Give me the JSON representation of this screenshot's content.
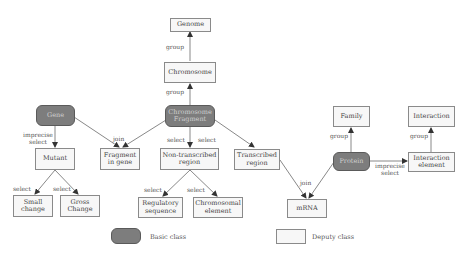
{
  "diagram": {
    "nodes": {
      "genome": {
        "label": "Genome",
        "type": "deputy"
      },
      "chromosome": {
        "label": "Chromosome",
        "type": "deputy"
      },
      "gene": {
        "label": "Gene",
        "type": "basic"
      },
      "chromosome_fragment": {
        "label": "Chromosome Fragment",
        "type": "basic"
      },
      "mutant": {
        "label": "Mutant",
        "type": "deputy"
      },
      "fragment_in_gene": {
        "label": "Fragment in gene",
        "type": "deputy"
      },
      "non_transcribed_region": {
        "label": "Non-transcribed region",
        "type": "deputy"
      },
      "transcribed_region": {
        "label": "Transcribed region",
        "type": "deputy"
      },
      "small_change": {
        "label": "Small change",
        "type": "deputy"
      },
      "gross_change": {
        "label": "Gross Change",
        "type": "deputy"
      },
      "regulatory_sequence": {
        "label": "Regulatory sequence",
        "type": "deputy"
      },
      "chromosomal_element": {
        "label": "Chromosomal element",
        "type": "deputy"
      },
      "mrna": {
        "label": "mRNA",
        "type": "deputy"
      },
      "protein": {
        "label": "Protein",
        "type": "basic"
      },
      "family": {
        "label": "Family",
        "type": "deputy"
      },
      "interaction_element": {
        "label": "Interaction element",
        "type": "deputy"
      },
      "interaction": {
        "label": "Interaction",
        "type": "deputy"
      }
    },
    "edge_labels": {
      "chromosome_to_genome": "group",
      "fragment_to_chromosome": "group",
      "gene_to_mutant": "imprecise select",
      "join_fragment_in_gene": "join",
      "fragment_to_nontranscribed_left": "select",
      "fragment_to_nontranscribed_right": "select",
      "mutant_to_small": "select",
      "mutant_to_gross": "select",
      "nontranscribed_to_regulatory": "select",
      "nontranscribed_to_chromosomal": "select",
      "join_mrna": "join",
      "protein_to_family": "group",
      "protein_to_interaction_element": "imprecise select",
      "interaction_element_to_interaction": "group"
    },
    "edges": [
      {
        "from": "chromosome",
        "to": "genome",
        "label": "group"
      },
      {
        "from": "chromosome_fragment",
        "to": "chromosome",
        "label": "group"
      },
      {
        "from": "gene",
        "to": "mutant",
        "label": "imprecise select"
      },
      {
        "from": "gene",
        "to": "fragment_in_gene",
        "label": "join"
      },
      {
        "from": "chromosome_fragment",
        "to": "fragment_in_gene",
        "label": "join"
      },
      {
        "from": "chromosome_fragment",
        "to": "non_transcribed_region",
        "label": "select"
      },
      {
        "from": "chromosome_fragment",
        "to": "transcribed_region",
        "label": "select"
      },
      {
        "from": "mutant",
        "to": "small_change",
        "label": "select"
      },
      {
        "from": "mutant",
        "to": "gross_change",
        "label": "select"
      },
      {
        "from": "non_transcribed_region",
        "to": "regulatory_sequence",
        "label": "select"
      },
      {
        "from": "non_transcribed_region",
        "to": "chromosomal_element",
        "label": "select"
      },
      {
        "from": "transcribed_region",
        "to": "mrna",
        "label": "join"
      },
      {
        "from": "protein",
        "to": "mrna",
        "label": "join"
      },
      {
        "from": "protein",
        "to": "family",
        "label": "group"
      },
      {
        "from": "protein",
        "to": "interaction_element",
        "label": "imprecise select"
      },
      {
        "from": "interaction_element",
        "to": "interaction",
        "label": "group"
      }
    ]
  },
  "legend": {
    "basic_class": "Basic class",
    "deputy_class": "Deputy class"
  },
  "colors": {
    "basic_fill": "#7d7d7d",
    "deputy_fill": "#f7f7f7",
    "edge": "#6a6a6a"
  }
}
